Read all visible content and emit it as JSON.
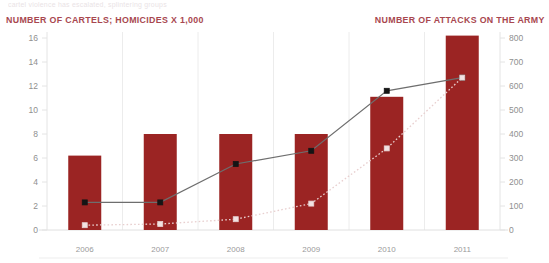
{
  "header": {
    "faded_top_text": "cartel violence has escalated, splintering groups",
    "left_axis_title": "NUMBER OF CARTELS; HOMICIDES X 1,000",
    "right_axis_title": "NUMBER OF ATTACKS ON THE ARMY",
    "title_color": "#a8474f"
  },
  "chart_data": {
    "type": "bar",
    "title": "",
    "subtitle": "",
    "categories": [
      "2006",
      "2007",
      "2008",
      "2009",
      "2010",
      "2011"
    ],
    "xlabel": "",
    "ylabel": "NUMBER OF CARTELS; HOMICIDES X 1,000",
    "y2label": "NUMBER OF ATTACKS ON THE ARMY",
    "ylim": [
      0,
      16
    ],
    "y2lim": [
      0,
      800
    ],
    "yticks": [
      0,
      2,
      4,
      6,
      8,
      10,
      12,
      14,
      16
    ],
    "y2ticks": [
      0,
      100,
      200,
      300,
      400,
      500,
      600,
      700,
      800
    ],
    "ytick_labels": [
      "0",
      "2",
      "4",
      "6",
      "8",
      "10",
      "12",
      "14",
      "16"
    ],
    "y2tick_labels": [
      "0",
      "100",
      "200",
      "300",
      "400",
      "500",
      "600",
      "700",
      "800"
    ],
    "grid": "vertical-only",
    "legend": "none",
    "bar_color": "#9b2423",
    "series": [
      {
        "name": "Homicides x 1,000",
        "type": "bar",
        "axis": "left",
        "color": "#9b2423",
        "values": [
          6.2,
          8.0,
          8.0,
          8.0,
          11.1,
          16.2
        ]
      },
      {
        "name": "Number of cartels",
        "type": "line",
        "axis": "left",
        "color": "#6e6e6e",
        "marker": "square-filled-dark",
        "line_style": "solid",
        "values": [
          2.3,
          2.3,
          5.5,
          6.6,
          11.6,
          12.7
        ]
      },
      {
        "name": "Attacks on the army",
        "type": "line",
        "axis": "right",
        "color": "#e8cfcf",
        "marker": "square-filled-light",
        "line_style": "dotted",
        "values": [
          20,
          25,
          45,
          110,
          340,
          635
        ]
      }
    ],
    "annotations": []
  }
}
